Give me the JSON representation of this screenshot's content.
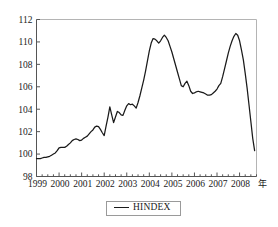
{
  "chart_data": {
    "type": "line",
    "title": "",
    "xlabel": "年",
    "ylabel": "",
    "ylim": [
      98,
      112
    ],
    "xlim": [
      1999.0,
      2008.75
    ],
    "yticks": [
      98,
      100,
      102,
      104,
      106,
      108,
      110,
      112
    ],
    "xticks": [
      1999,
      2000,
      2001,
      2002,
      2003,
      2004,
      2005,
      2006,
      2007,
      2008
    ],
    "xtick_labels": [
      "1999",
      "2000",
      "2001",
      "2002",
      "2003",
      "2004",
      "2005",
      "2006",
      "2007",
      "2008"
    ],
    "ytick_labels": [
      "98",
      "100",
      "102",
      "104",
      "106",
      "108",
      "110",
      "112"
    ],
    "grid": false,
    "minor_ticks": true,
    "minor_tick_interval": 0.25,
    "legend": {
      "position": "bottom-center",
      "entries": [
        {
          "name": "HINDEX",
          "color": "#1a1a1a",
          "style": "solid"
        }
      ]
    },
    "series": [
      {
        "name": "HINDEX",
        "color": "#1a1a1a",
        "x": [
          1999.0,
          1999.083,
          1999.167,
          1999.25,
          1999.333,
          1999.417,
          1999.5,
          1999.583,
          1999.667,
          1999.75,
          1999.833,
          1999.917,
          2000.0,
          2000.083,
          2000.167,
          2000.25,
          2000.333,
          2000.417,
          2000.5,
          2000.583,
          2000.667,
          2000.75,
          2000.833,
          2000.917,
          2001.0,
          2001.083,
          2001.167,
          2001.25,
          2001.333,
          2001.417,
          2001.5,
          2001.583,
          2001.667,
          2001.75,
          2001.833,
          2001.917,
          2002.0,
          2002.083,
          2002.167,
          2002.25,
          2002.333,
          2002.417,
          2002.5,
          2002.583,
          2002.667,
          2002.75,
          2002.833,
          2002.917,
          2003.0,
          2003.083,
          2003.167,
          2003.25,
          2003.333,
          2003.417,
          2003.5,
          2003.583,
          2003.667,
          2003.75,
          2003.833,
          2003.917,
          2004.0,
          2004.083,
          2004.167,
          2004.25,
          2004.333,
          2004.417,
          2004.5,
          2004.583,
          2004.667,
          2004.75,
          2004.833,
          2004.917,
          2005.0,
          2005.083,
          2005.167,
          2005.25,
          2005.333,
          2005.417,
          2005.5,
          2005.583,
          2005.667,
          2005.75,
          2005.833,
          2005.917,
          2006.0,
          2006.083,
          2006.167,
          2006.25,
          2006.333,
          2006.417,
          2006.5,
          2006.583,
          2006.667,
          2006.75,
          2006.833,
          2006.917,
          2007.0,
          2007.083,
          2007.167,
          2007.25,
          2007.333,
          2007.417,
          2007.5,
          2007.583,
          2007.667,
          2007.75,
          2007.833,
          2007.917,
          2008.0,
          2008.083,
          2008.167,
          2008.25,
          2008.333,
          2008.417,
          2008.5,
          2008.583,
          2008.667
        ],
        "values": [
          99.6,
          99.6,
          99.6,
          99.65,
          99.7,
          99.7,
          99.75,
          99.8,
          99.9,
          100.0,
          100.1,
          100.3,
          100.55,
          100.6,
          100.6,
          100.6,
          100.7,
          100.85,
          101.0,
          101.2,
          101.3,
          101.35,
          101.3,
          101.2,
          101.25,
          101.4,
          101.5,
          101.6,
          101.8,
          102.0,
          102.15,
          102.4,
          102.5,
          102.45,
          102.2,
          101.9,
          101.65,
          102.5,
          103.3,
          104.2,
          103.5,
          102.8,
          103.3,
          103.8,
          103.7,
          103.5,
          103.45,
          103.9,
          104.3,
          104.5,
          104.4,
          104.45,
          104.3,
          104.1,
          104.6,
          105.2,
          105.9,
          106.6,
          107.4,
          108.3,
          109.2,
          109.9,
          110.3,
          110.25,
          110.1,
          109.9,
          110.1,
          110.4,
          110.6,
          110.4,
          110.1,
          109.6,
          109.1,
          108.5,
          107.9,
          107.3,
          106.7,
          106.1,
          106.0,
          106.3,
          106.5,
          106.1,
          105.6,
          105.4,
          105.45,
          105.55,
          105.6,
          105.55,
          105.5,
          105.45,
          105.35,
          105.25,
          105.25,
          105.3,
          105.45,
          105.6,
          105.8,
          106.1,
          106.3,
          106.9,
          107.6,
          108.3,
          109.0,
          109.6,
          110.1,
          110.5,
          110.75,
          110.6,
          110.1,
          109.3,
          108.4,
          107.2,
          105.9,
          104.4,
          102.9,
          101.4,
          100.3
        ]
      }
    ],
    "annotations": [
      {
        "text": "年",
        "meaning": "year-unit-suffix",
        "position": "x-axis-end"
      }
    ]
  },
  "legend": {
    "label": "HINDEX"
  },
  "axis": {
    "x_unit_suffix": "年"
  }
}
